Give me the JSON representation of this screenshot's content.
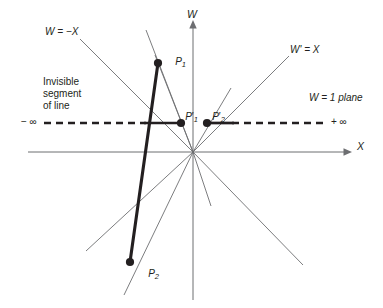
{
  "figure": {
    "background": "#ffffff",
    "ink": "#231f20",
    "thin_stroke": "#6d6e71",
    "width": 383,
    "height": 308
  },
  "axes": {
    "w_label": "W",
    "x_label": "X",
    "origin": {
      "x": 193,
      "y": 152
    },
    "w_axis": {
      "x": 193,
      "y_top": 22,
      "y_bottom": 300
    },
    "x_axis": {
      "y": 152,
      "x_left": 28,
      "x_right": 352
    }
  },
  "labels": {
    "w_eq_minus_x": "W = −X",
    "w_prime_eq_x": "W' = X",
    "w_eq_1_plane": "W = 1 plane",
    "invisible_line_1": "Invisible",
    "invisible_line_2": "segment",
    "invisible_line_3": "of line",
    "minus_infinity": "− ∞",
    "plus_infinity": "+ ∞"
  },
  "points": [
    {
      "id": "p1",
      "label": "P",
      "sub": "1",
      "prime": false,
      "x": 158,
      "y": 63,
      "label_x": 164,
      "label_y": 47
    },
    {
      "id": "p1-prime",
      "label": "P",
      "sub": "1",
      "prime": true,
      "x": 181,
      "y": 123,
      "label_x": 176,
      "label_y": 101
    },
    {
      "id": "p2-prime",
      "label": "P",
      "sub": "2",
      "prime": true,
      "x": 207,
      "y": 123,
      "label_x": 203,
      "label_y": 101
    },
    {
      "id": "p2",
      "label": "P",
      "sub": "2",
      "prime": false,
      "x": 130,
      "y": 262,
      "label_x": 137,
      "label_y": 260
    }
  ],
  "segments": {
    "thick_line": {
      "from": {
        "x": 158,
        "y": 63
      },
      "to": {
        "x": 130,
        "y": 262
      },
      "width": 3.0
    },
    "visible_ray_left": {
      "from": {
        "x": 144,
        "y": 123
      },
      "to": {
        "x": 181,
        "y": 123
      },
      "width": 2.6
    },
    "visible_ray_right": {
      "from": {
        "x": 207,
        "y": 123
      },
      "to": {
        "x": 233,
        "y": 123
      },
      "width": 2.6
    },
    "dashed_w1_plane": {
      "y": 123,
      "x_left": 44,
      "x_right": 328,
      "dash": "7 5",
      "width": 2.6
    }
  },
  "rays": [
    {
      "name": "w-eq-minus-x-ray",
      "x2": 80,
      "y2": 39
    },
    {
      "name": "ray-to-p1-upper",
      "x2": 146,
      "y2": 30
    },
    {
      "name": "ray-through-p1",
      "x2": 158,
      "y2": 63
    },
    {
      "name": "ray-w-prime-eq-x",
      "x2": 289,
      "y2": 56
    },
    {
      "name": "ray-p2-prime-upper",
      "x2": 231,
      "y2": 88
    },
    {
      "name": "ray-lower-left-a",
      "x2": 86,
      "y2": 251
    },
    {
      "name": "ray-lower-left-b",
      "x2": 124,
      "y2": 295
    },
    {
      "name": "ray-lower-right-a",
      "x2": 211,
      "y2": 206
    },
    {
      "name": "ray-lower-right-b",
      "x2": 303,
      "y2": 265
    }
  ],
  "icons": {
    "w_axis_arrow": "arrow-up-icon",
    "x_axis_arrow": "arrow-right-icon"
  }
}
